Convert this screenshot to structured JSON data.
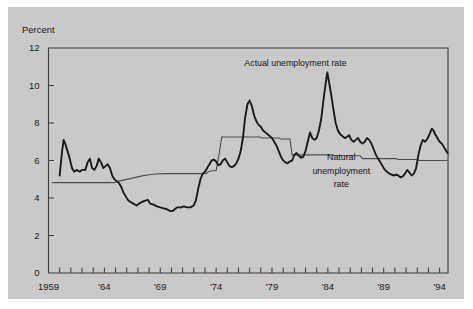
{
  "figure": {
    "background_color": "#ffffff",
    "panel_color": "#c9c9c9",
    "axis_color": "#3a3a3a"
  },
  "chart_data": {
    "type": "line",
    "title": "",
    "subtitle": "",
    "xlabel": "",
    "ylabel": "Percent",
    "ylim": [
      0,
      12
    ],
    "xlim": [
      1959,
      1994.75
    ],
    "yticks": [
      0,
      2,
      4,
      6,
      8,
      10,
      12
    ],
    "ytick_labels": [
      "0",
      "2",
      "4",
      "6",
      "8",
      "10",
      "12"
    ],
    "xticks": [
      1959,
      1960,
      1961,
      1962,
      1963,
      1964,
      1965,
      1966,
      1967,
      1968,
      1969,
      1970,
      1971,
      1972,
      1973,
      1974,
      1975,
      1976,
      1977,
      1978,
      1979,
      1980,
      1981,
      1982,
      1983,
      1984,
      1985,
      1986,
      1987,
      1988,
      1989,
      1990,
      1991,
      1992,
      1993,
      1994
    ],
    "xtick_labels": [
      "1959",
      "",
      "",
      "",
      "",
      "'64",
      "",
      "",
      "",
      "",
      "'69",
      "",
      "",
      "",
      "",
      "'74",
      "",
      "",
      "",
      "",
      "'79",
      "",
      "",
      "",
      "",
      "'84",
      "",
      "",
      "",
      "",
      "'89",
      "",
      "",
      "",
      "",
      "'94"
    ],
    "grid": false,
    "legend_position": "inline-annotations",
    "annotations": [
      {
        "name": "actual-series-label",
        "text": "Actual unemployment rate",
        "x_year": 1981.1,
        "y_value": 11.05,
        "anchor": "middle"
      },
      {
        "name": "natural-series-label-line1",
        "text": "Natural",
        "x_year": 1985.2,
        "y_value": 6.05,
        "anchor": "middle"
      },
      {
        "name": "natural-series-label-line2",
        "text": "unemployment",
        "x_year": 1985.2,
        "y_value": 5.3,
        "anchor": "middle"
      },
      {
        "name": "natural-series-label-line3",
        "text": "rate",
        "x_year": 1985.2,
        "y_value": 4.6,
        "anchor": "middle"
      }
    ],
    "series": [
      {
        "name": "Actual unemployment rate",
        "color": "#1a1a1a",
        "line_width": 1.9,
        "points": [
          [
            1960.0,
            5.2
          ],
          [
            1960.2,
            6.4
          ],
          [
            1960.35,
            7.1
          ],
          [
            1960.5,
            6.9
          ],
          [
            1960.7,
            6.5
          ],
          [
            1960.9,
            6.1
          ],
          [
            1961.1,
            5.6
          ],
          [
            1961.3,
            5.4
          ],
          [
            1961.5,
            5.5
          ],
          [
            1961.8,
            5.4
          ],
          [
            1962.0,
            5.5
          ],
          [
            1962.3,
            5.5
          ],
          [
            1962.5,
            5.9
          ],
          [
            1962.7,
            6.1
          ],
          [
            1962.9,
            5.6
          ],
          [
            1963.1,
            5.5
          ],
          [
            1963.3,
            5.7
          ],
          [
            1963.5,
            6.1
          ],
          [
            1963.7,
            5.9
          ],
          [
            1963.9,
            5.6
          ],
          [
            1964.1,
            5.7
          ],
          [
            1964.3,
            5.8
          ],
          [
            1964.5,
            5.6
          ],
          [
            1964.7,
            5.2
          ],
          [
            1964.9,
            5.0
          ],
          [
            1965.1,
            4.9
          ],
          [
            1965.3,
            4.8
          ],
          [
            1965.5,
            4.6
          ],
          [
            1965.7,
            4.3
          ],
          [
            1965.9,
            4.1
          ],
          [
            1966.1,
            3.9
          ],
          [
            1966.3,
            3.8
          ],
          [
            1966.6,
            3.7
          ],
          [
            1966.9,
            3.6
          ],
          [
            1967.1,
            3.7
          ],
          [
            1967.4,
            3.8
          ],
          [
            1967.6,
            3.85
          ],
          [
            1967.9,
            3.9
          ],
          [
            1968.1,
            3.7
          ],
          [
            1968.4,
            3.65
          ],
          [
            1968.7,
            3.55
          ],
          [
            1969.0,
            3.5
          ],
          [
            1969.3,
            3.45
          ],
          [
            1969.6,
            3.4
          ],
          [
            1969.9,
            3.3
          ],
          [
            1970.1,
            3.3
          ],
          [
            1970.3,
            3.4
          ],
          [
            1970.5,
            3.5
          ],
          [
            1970.7,
            3.5
          ],
          [
            1970.9,
            3.5
          ],
          [
            1971.1,
            3.55
          ],
          [
            1971.4,
            3.5
          ],
          [
            1971.7,
            3.5
          ],
          [
            1972.0,
            3.6
          ],
          [
            1972.2,
            3.9
          ],
          [
            1972.4,
            4.5
          ],
          [
            1972.6,
            5.0
          ],
          [
            1972.8,
            5.3
          ],
          [
            1973.0,
            5.4
          ],
          [
            1973.2,
            5.6
          ],
          [
            1973.4,
            5.8
          ],
          [
            1973.6,
            6.0
          ],
          [
            1973.8,
            6.05
          ],
          [
            1974.0,
            5.95
          ],
          [
            1974.2,
            5.75
          ],
          [
            1974.4,
            5.8
          ],
          [
            1974.6,
            6.0
          ],
          [
            1974.8,
            6.1
          ],
          [
            1975.0,
            5.9
          ],
          [
            1975.2,
            5.7
          ],
          [
            1975.4,
            5.65
          ],
          [
            1975.6,
            5.7
          ],
          [
            1975.8,
            5.85
          ],
          [
            1976.0,
            6.1
          ],
          [
            1976.2,
            6.5
          ],
          [
            1976.4,
            7.2
          ],
          [
            1976.6,
            8.3
          ],
          [
            1976.8,
            9.0
          ],
          [
            1977.0,
            9.2
          ],
          [
            1977.2,
            8.9
          ],
          [
            1977.4,
            8.4
          ],
          [
            1977.6,
            8.1
          ],
          [
            1977.8,
            7.9
          ],
          [
            1978.0,
            7.8
          ],
          [
            1978.2,
            7.6
          ],
          [
            1978.4,
            7.5
          ],
          [
            1978.6,
            7.4
          ],
          [
            1978.8,
            7.3
          ],
          [
            1979.0,
            7.2
          ],
          [
            1979.2,
            7.0
          ],
          [
            1979.4,
            6.8
          ],
          [
            1979.6,
            6.5
          ],
          [
            1979.8,
            6.2
          ],
          [
            1980.0,
            6.0
          ],
          [
            1980.2,
            5.9
          ],
          [
            1980.4,
            5.85
          ],
          [
            1980.6,
            5.95
          ],
          [
            1980.8,
            6.0
          ],
          [
            1981.0,
            6.3
          ],
          [
            1981.2,
            6.4
          ],
          [
            1981.4,
            6.25
          ],
          [
            1981.6,
            6.15
          ],
          [
            1981.8,
            6.2
          ],
          [
            1982.0,
            6.5
          ],
          [
            1982.2,
            7.0
          ],
          [
            1982.4,
            7.5
          ],
          [
            1982.6,
            7.2
          ],
          [
            1982.8,
            7.1
          ],
          [
            1983.0,
            7.2
          ],
          [
            1983.2,
            7.6
          ],
          [
            1983.4,
            8.2
          ],
          [
            1983.6,
            9.2
          ],
          [
            1983.8,
            10.1
          ],
          [
            1983.95,
            10.7
          ],
          [
            1984.1,
            10.2
          ],
          [
            1984.3,
            9.5
          ],
          [
            1984.5,
            8.7
          ],
          [
            1984.7,
            8.0
          ],
          [
            1984.9,
            7.6
          ],
          [
            1985.1,
            7.4
          ],
          [
            1985.3,
            7.3
          ],
          [
            1985.5,
            7.2
          ],
          [
            1985.7,
            7.25
          ],
          [
            1985.9,
            7.35
          ],
          [
            1986.1,
            7.1
          ],
          [
            1986.3,
            7.0
          ],
          [
            1986.5,
            7.1
          ],
          [
            1986.7,
            7.2
          ],
          [
            1986.9,
            7.0
          ],
          [
            1987.1,
            6.9
          ],
          [
            1987.3,
            7.0
          ],
          [
            1987.5,
            7.2
          ],
          [
            1987.7,
            7.1
          ],
          [
            1987.9,
            6.9
          ],
          [
            1988.1,
            6.6
          ],
          [
            1988.3,
            6.3
          ],
          [
            1988.5,
            6.1
          ],
          [
            1988.7,
            5.9
          ],
          [
            1988.9,
            5.7
          ],
          [
            1989.1,
            5.5
          ],
          [
            1989.3,
            5.4
          ],
          [
            1989.5,
            5.3
          ],
          [
            1989.7,
            5.25
          ],
          [
            1989.9,
            5.2
          ],
          [
            1990.1,
            5.25
          ],
          [
            1990.3,
            5.2
          ],
          [
            1990.5,
            5.1
          ],
          [
            1990.7,
            5.15
          ],
          [
            1990.9,
            5.3
          ],
          [
            1991.1,
            5.5
          ],
          [
            1991.3,
            5.35
          ],
          [
            1991.5,
            5.2
          ],
          [
            1991.7,
            5.3
          ],
          [
            1991.9,
            5.6
          ],
          [
            1992.1,
            6.3
          ],
          [
            1992.3,
            6.8
          ],
          [
            1992.5,
            7.1
          ],
          [
            1992.7,
            7.0
          ],
          [
            1992.9,
            7.15
          ],
          [
            1993.1,
            7.4
          ],
          [
            1993.3,
            7.7
          ],
          [
            1993.45,
            7.6
          ],
          [
            1993.6,
            7.4
          ],
          [
            1993.8,
            7.2
          ],
          [
            1994.0,
            7.0
          ],
          [
            1994.2,
            6.9
          ],
          [
            1994.4,
            6.7
          ],
          [
            1994.55,
            6.55
          ],
          [
            1994.7,
            6.4
          ]
        ]
      },
      {
        "name": "Natural unemployment rate",
        "color": "#4d4d4d",
        "line_width": 1.1,
        "points": [
          [
            1959.3,
            4.82
          ],
          [
            1964.9,
            4.82
          ],
          [
            1965.1,
            4.88
          ],
          [
            1965.6,
            4.94
          ],
          [
            1966.2,
            5.02
          ],
          [
            1966.8,
            5.1
          ],
          [
            1967.4,
            5.18
          ],
          [
            1968.0,
            5.24
          ],
          [
            1968.6,
            5.28
          ],
          [
            1969.3,
            5.3
          ],
          [
            1973.1,
            5.3
          ],
          [
            1973.3,
            5.4
          ],
          [
            1973.6,
            5.45
          ],
          [
            1974.0,
            5.45
          ],
          [
            1974.3,
            6.45
          ],
          [
            1974.5,
            7.25
          ],
          [
            1977.9,
            7.25
          ],
          [
            1978.1,
            7.2
          ],
          [
            1979.6,
            7.2
          ],
          [
            1979.8,
            7.15
          ],
          [
            1980.6,
            7.15
          ],
          [
            1980.8,
            6.3
          ],
          [
            1984.4,
            6.3
          ],
          [
            1984.6,
            6.25
          ],
          [
            1986.9,
            6.25
          ],
          [
            1987.1,
            6.1
          ],
          [
            1990.1,
            6.1
          ],
          [
            1990.3,
            6.05
          ],
          [
            1991.9,
            6.05
          ],
          [
            1992.2,
            6.0
          ],
          [
            1994.7,
            6.0
          ]
        ]
      }
    ]
  },
  "axis": {
    "y_axis_title": "Percent",
    "x_start_label": "1959",
    "x_end_label": "'94"
  }
}
